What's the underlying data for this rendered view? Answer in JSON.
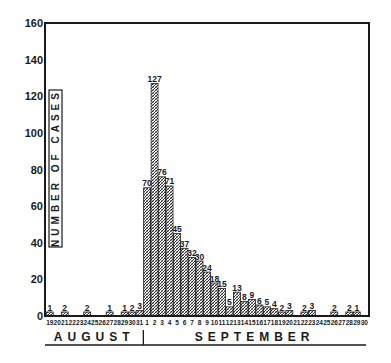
{
  "chart_data": {
    "type": "bar",
    "title": "",
    "xlabel": "",
    "ylabel": "NUMBER OF CASES",
    "ylim": [
      0,
      160
    ],
    "yticks": [
      0,
      20,
      40,
      60,
      80,
      100,
      120,
      140,
      160
    ],
    "grid": false,
    "months": [
      {
        "label": "AUGUST",
        "days": [
          19,
          20,
          21,
          22,
          23,
          24,
          25,
          26,
          27,
          28,
          29,
          30,
          31
        ]
      },
      {
        "label": "SEPTEMBER",
        "days": [
          1,
          2,
          3,
          4,
          5,
          6,
          7,
          8,
          9,
          10,
          11,
          12,
          13,
          14,
          15,
          16,
          17,
          18,
          19,
          20,
          21,
          22,
          23,
          24,
          25,
          26,
          27,
          28,
          29,
          30
        ]
      }
    ],
    "categories": [
      "Aug 19",
      "Aug 20",
      "Aug 21",
      "Aug 22",
      "Aug 23",
      "Aug 24",
      "Aug 25",
      "Aug 26",
      "Aug 27",
      "Aug 28",
      "Aug 29",
      "Aug 30",
      "Aug 31",
      "Sep 1",
      "Sep 2",
      "Sep 3",
      "Sep 4",
      "Sep 5",
      "Sep 6",
      "Sep 7",
      "Sep 8",
      "Sep 9",
      "Sep 10",
      "Sep 11",
      "Sep 12",
      "Sep 13",
      "Sep 14",
      "Sep 15",
      "Sep 16",
      "Sep 17",
      "Sep 18",
      "Sep 19",
      "Sep 20",
      "Sep 21",
      "Sep 22",
      "Sep 23",
      "Sep 24",
      "Sep 25",
      "Sep 26",
      "Sep 27",
      "Sep 28",
      "Sep 29",
      "Sep 30"
    ],
    "values": [
      1,
      0,
      2,
      0,
      0,
      2,
      0,
      0,
      1,
      0,
      1,
      2,
      3,
      70,
      127,
      76,
      71,
      45,
      37,
      32,
      30,
      24,
      18,
      15,
      5,
      13,
      8,
      9,
      6,
      5,
      4,
      2,
      3,
      0,
      2,
      3,
      0,
      0,
      2,
      0,
      2,
      1,
      0
    ],
    "tick_labels": [
      "19",
      "20",
      "21",
      "22",
      "23",
      "24",
      "25",
      "26",
      "27",
      "28",
      "29",
      "30",
      "31",
      "1",
      "2",
      "3",
      "4",
      "5",
      "6",
      "7",
      "8",
      "9",
      "10",
      "11",
      "12",
      "13",
      "14",
      "15",
      "16",
      "17",
      "18",
      "19",
      "20",
      "21",
      "22",
      "23",
      "24",
      "25",
      "26",
      "27",
      "28",
      "29",
      "30"
    ]
  },
  "style": {
    "ink": "#1a1a1a",
    "bar_fill": "#d9d9d9",
    "background": "#ffffff"
  }
}
